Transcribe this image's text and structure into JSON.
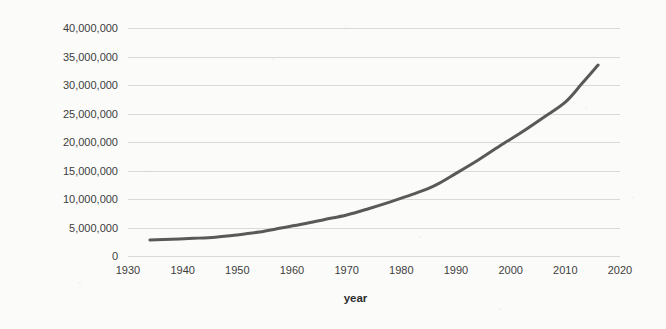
{
  "chart_data": {
    "type": "line",
    "title": "",
    "xlabel": "year",
    "ylabel": "Population of elderly people",
    "xlim": [
      1930,
      2020
    ],
    "ylim": [
      0,
      40000000
    ],
    "grid": true,
    "legend": "none",
    "series_color": "#595959",
    "x_ticks": [
      "1930",
      "1940",
      "1950",
      "1960",
      "1970",
      "1980",
      "1990",
      "2000",
      "2010",
      "2020"
    ],
    "x_tick_values": [
      1930,
      1940,
      1950,
      1960,
      1970,
      1980,
      1990,
      2000,
      2010,
      2020
    ],
    "y_ticks": [
      "0",
      "5,000,000",
      "10,000,000",
      "15,000,000",
      "20,000,000",
      "25,000,000",
      "30,000,000",
      "35,000,000",
      "40,000,000"
    ],
    "y_tick_values": [
      0,
      5000000,
      10000000,
      15000000,
      20000000,
      25000000,
      30000000,
      35000000,
      40000000
    ],
    "series": [
      {
        "name": "Population of elderly people",
        "x": [
          1934,
          1938,
          1942,
          1946,
          1950,
          1954,
          1958,
          1962,
          1966,
          1970,
          1974,
          1978,
          1982,
          1986,
          1990,
          1994,
          1998,
          2002,
          2006,
          2010,
          2013,
          2016
        ],
        "values": [
          2800000,
          2950000,
          3100000,
          3300000,
          3700000,
          4200000,
          4900000,
          5600000,
          6400000,
          7200000,
          8300000,
          9500000,
          10800000,
          12300000,
          14500000,
          16800000,
          19300000,
          21700000,
          24300000,
          27000000,
          30200000,
          33500000
        ]
      }
    ]
  }
}
